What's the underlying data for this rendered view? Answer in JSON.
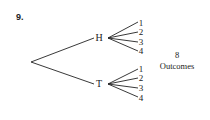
{
  "problem_number": "9.",
  "tree": {
    "root": {
      "x": 31,
      "y": 62
    },
    "branches": [
      {
        "label": "H",
        "label_pos": {
          "x": 99,
          "y": 41
        },
        "hub": {
          "x": 108,
          "y": 38
        },
        "leaves": [
          {
            "label": "1",
            "x": 141,
            "y": 26,
            "end": {
              "x": 138,
              "y": 22
            }
          },
          {
            "label": "2",
            "x": 141,
            "y": 35,
            "end": {
              "x": 138,
              "y": 32
            }
          },
          {
            "label": "3",
            "x": 141,
            "y": 45,
            "end": {
              "x": 138,
              "y": 42
            }
          },
          {
            "label": "4",
            "x": 141,
            "y": 54,
            "end": {
              "x": 138,
              "y": 51
            }
          }
        ]
      },
      {
        "label": "T",
        "label_pos": {
          "x": 99,
          "y": 87
        },
        "hub": {
          "x": 108,
          "y": 84
        },
        "leaves": [
          {
            "label": "1",
            "x": 141,
            "y": 72,
            "end": {
              "x": 138,
              "y": 69
            }
          },
          {
            "label": "2",
            "x": 141,
            "y": 81,
            "end": {
              "x": 138,
              "y": 78
            }
          },
          {
            "label": "3",
            "x": 141,
            "y": 91,
            "end": {
              "x": 138,
              "y": 88
            }
          },
          {
            "label": "4",
            "x": 141,
            "y": 101,
            "end": {
              "x": 138,
              "y": 97
            }
          }
        ]
      }
    ]
  },
  "outcomes": {
    "count": "8",
    "label": "Outcomes"
  }
}
